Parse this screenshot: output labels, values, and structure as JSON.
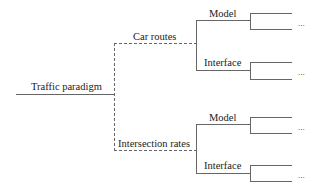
{
  "diagram": {
    "type": "tree",
    "root": {
      "label": "Traffic paradigm"
    },
    "branches": [
      {
        "label": "Car routes",
        "connector": "dashed",
        "children": [
          {
            "label": "Model",
            "leaves": [
              "",
              ""
            ],
            "ellipsis": "..."
          },
          {
            "label": "Interface",
            "leaves": [
              "",
              ""
            ],
            "ellipsis": "..."
          }
        ]
      },
      {
        "label": "Intersection rates",
        "connector": "dashed",
        "children": [
          {
            "label": "Model",
            "leaves": [
              "",
              ""
            ],
            "ellipsis": "..."
          },
          {
            "label": "Interface",
            "leaves": [
              "",
              ""
            ],
            "ellipsis": "..."
          }
        ]
      }
    ],
    "colors": {
      "line": "#666666",
      "text": "#222222"
    }
  }
}
